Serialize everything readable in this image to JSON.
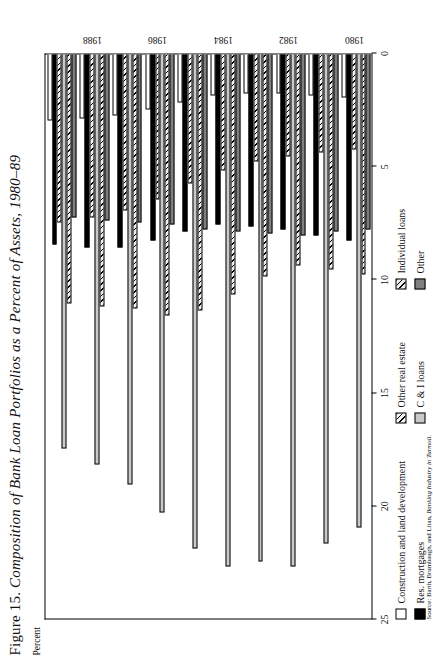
{
  "figure": {
    "number": "Figure 15.",
    "title": "Composition of Bank Loan Portfolios as a Percent of Assets, 1980–89",
    "axis_unit_label": "Percent",
    "source_prefix": "Source:",
    "source_authors": "Barth, Brumbaugh, and Litan,",
    "source_work": "Banking Industry in Turmoil."
  },
  "legend": {
    "items": [
      {
        "label": "Construction and land development",
        "key": "s0",
        "color": "#ffffff"
      },
      {
        "label": "Other real estate",
        "key": "s2",
        "color": "#f2f2f2"
      },
      {
        "label": "Individual loans",
        "key": "s4",
        "color": "#ededed"
      },
      {
        "label": "Res. mortgages",
        "key": "s1",
        "color": "#000000"
      },
      {
        "label": "C & I loans",
        "key": "s3",
        "color": "#c9c9c9"
      },
      {
        "label": "Other",
        "key": "s5",
        "color": "#7f7f7f"
      }
    ]
  },
  "chart_data": {
    "type": "bar",
    "orientation": "horizontal",
    "title": "Composition of Bank Loan Portfolios as a Percent of Assets, 1980–89",
    "xlabel": "Percent",
    "ylabel": "",
    "xlim": [
      0,
      25
    ],
    "xticks": [
      0,
      5,
      10,
      15,
      20,
      25
    ],
    "xticklabels": [
      "0",
      "5",
      "10",
      "15",
      "20",
      "25"
    ],
    "grid": false,
    "legend_position": "bottom",
    "categories": [
      "1980",
      "1981",
      "1982",
      "1983",
      "1984",
      "1985",
      "1986",
      "1987",
      "1988",
      "1989"
    ],
    "category_ticklabels": [
      "1980",
      "",
      "1982",
      "",
      "1984",
      "",
      "1986",
      "",
      "1988",
      ""
    ],
    "series": [
      {
        "name": "Construction and land development",
        "values": [
          2.0,
          1.9,
          1.8,
          1.8,
          1.9,
          2.2,
          2.5,
          2.8,
          2.9,
          3.0
        ]
      },
      {
        "name": "Res. mortgages",
        "values": [
          8.3,
          8.1,
          7.8,
          7.7,
          7.6,
          7.9,
          8.3,
          8.6,
          8.6,
          8.5
        ]
      },
      {
        "name": "Other real estate",
        "values": [
          4.3,
          4.4,
          4.6,
          4.8,
          5.2,
          5.8,
          6.5,
          7.0,
          7.3,
          7.5
        ]
      },
      {
        "name": "C & I loans",
        "values": [
          21.0,
          21.7,
          22.7,
          22.5,
          22.7,
          21.9,
          20.3,
          19.1,
          18.2,
          17.5
        ]
      },
      {
        "name": "Individual loans",
        "values": [
          9.8,
          9.6,
          9.4,
          9.9,
          10.7,
          11.4,
          11.6,
          11.3,
          11.2,
          11.1
        ]
      },
      {
        "name": "Other",
        "values": [
          7.8,
          7.9,
          8.1,
          8.0,
          7.9,
          7.8,
          7.6,
          7.5,
          7.4,
          7.3
        ]
      }
    ]
  }
}
